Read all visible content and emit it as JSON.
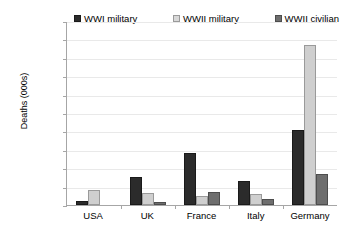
{
  "chart_data": {
    "type": "bar",
    "title": "",
    "xlabel": "",
    "ylabel": "Deaths (000s)",
    "ylim": [
      0,
      5000
    ],
    "ytick_step": 500,
    "grid": true,
    "legend_position": "top",
    "categories": [
      "USA",
      "UK",
      "France",
      "Italy",
      "Germany"
    ],
    "ytick_labels": [
      "0",
      "500",
      "1,000",
      "1,500",
      "2,000",
      "2,500",
      "3,000",
      "3,500",
      "4,000",
      "4,500",
      "5,000"
    ],
    "series": [
      {
        "name": "WWI military",
        "color": "#2b2b2b",
        "values": [
          117,
          750,
          1400,
          650,
          2050
        ]
      },
      {
        "name": "WWII military",
        "color": "#cfcfcf",
        "values": [
          405,
          330,
          250,
          300,
          4350
        ]
      },
      {
        "name": "WWII civilian",
        "color": "#6e6e6e",
        "values": [
          0,
          90,
          350,
          150,
          850
        ]
      }
    ]
  }
}
